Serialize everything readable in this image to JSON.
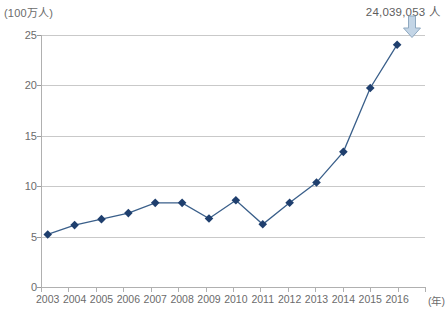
{
  "chart_data": {
    "type": "line",
    "title": "",
    "subtitle": "",
    "xlabel": "(年)",
    "ylabel": "(100万人)",
    "categories": [
      "2003",
      "2004",
      "2005",
      "2006",
      "2007",
      "2008",
      "2009",
      "2010",
      "2011",
      "2012",
      "2013",
      "2014",
      "2015",
      "2016"
    ],
    "values": [
      5.21,
      6.14,
      6.73,
      7.33,
      8.35,
      8.35,
      6.79,
      8.61,
      6.22,
      8.36,
      10.36,
      13.41,
      19.74,
      24.04
    ],
    "series": [
      {
        "name": "訪日外客数",
        "values": [
          5.21,
          6.14,
          6.73,
          7.33,
          8.35,
          8.35,
          6.79,
          8.61,
          6.22,
          8.36,
          10.36,
          13.41,
          19.74,
          24.04
        ]
      }
    ],
    "ylim": [
      0,
      25
    ],
    "ytick_labels": [
      "0",
      "5",
      "10",
      "15",
      "20",
      "25"
    ],
    "ytick_values": [
      0,
      5,
      10,
      15,
      20,
      25
    ],
    "grid": true,
    "legend": false,
    "legend_position": "none",
    "annotations": [
      {
        "name": "last-point-callout",
        "text": "24,039,053 人",
        "target_category": "2016",
        "target_value": 24.04,
        "arrow": "down-arrow-icon"
      }
    ],
    "colors": {
      "line": "#3a5f8a",
      "marker": "#1f3f6e",
      "grid": "#c9c9c9",
      "axis": "#b0b0b0",
      "text": "#6b6b6b",
      "annotation_text": "#5d5d5d",
      "arrow_fill": "#c3d5e6",
      "arrow_stroke": "#8fa9c0"
    }
  },
  "axis": {
    "y_unit": "(100万人)",
    "x_unit": "(年)"
  }
}
